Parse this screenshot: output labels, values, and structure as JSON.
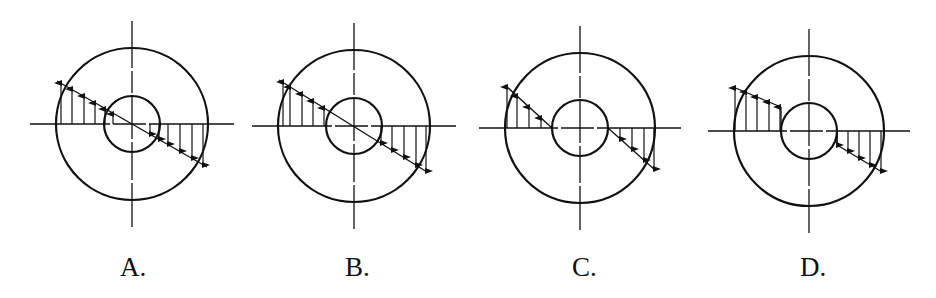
{
  "figure": {
    "stroke_color": "#111111",
    "background": "#ffffff"
  },
  "options": [
    {
      "label": "A.",
      "center": [
        132,
        124
      ],
      "outer_radius": 76,
      "inner_radius": 28,
      "distribution": "linear-through-center-full",
      "profile_lines": [
        [
          [
            57,
            81
          ],
          [
            207,
            167
          ]
        ]
      ],
      "arrows": [
        {
          "x": 61,
          "from": 124,
          "to": 83
        },
        {
          "x": 72,
          "from": 124,
          "to": 89
        },
        {
          "x": 84,
          "from": 124,
          "to": 96
        },
        {
          "x": 95,
          "from": 124,
          "to": 103
        },
        {
          "x": 105,
          "from": 124,
          "to": 109
        },
        {
          "x": 113,
          "from": 124,
          "to": 114
        },
        {
          "x": 150,
          "from": 124,
          "to": 134
        },
        {
          "x": 159,
          "from": 124,
          "to": 139
        },
        {
          "x": 168,
          "from": 124,
          "to": 144
        },
        {
          "x": 180,
          "from": 124,
          "to": 151
        },
        {
          "x": 192,
          "from": 124,
          "to": 158
        },
        {
          "x": 203,
          "from": 124,
          "to": 165
        }
      ]
    },
    {
      "label": "B.",
      "center": [
        354,
        126
      ],
      "outer_radius": 76,
      "inner_radius": 28,
      "distribution": "linear-through-center-annulus",
      "profile_lines": [
        [
          [
            279,
            80
          ],
          [
            427,
            172
          ]
        ]
      ],
      "arrows": [
        {
          "x": 283,
          "from": 126,
          "to": 82
        },
        {
          "x": 290,
          "from": 126,
          "to": 87
        },
        {
          "x": 302,
          "from": 126,
          "to": 94
        },
        {
          "x": 313,
          "from": 126,
          "to": 101
        },
        {
          "x": 324,
          "from": 126,
          "to": 108
        },
        {
          "x": 381,
          "from": 126,
          "to": 143
        },
        {
          "x": 392,
          "from": 126,
          "to": 150
        },
        {
          "x": 404,
          "from": 126,
          "to": 157
        },
        {
          "x": 416,
          "from": 126,
          "to": 165
        },
        {
          "x": 426,
          "from": 126,
          "to": 171
        }
      ]
    },
    {
      "label": "C.",
      "center": [
        580,
        128
      ],
      "outer_radius": 75,
      "inner_radius": 28,
      "distribution": "linear-zero-at-inner-radius",
      "profile_lines": [
        [
          [
            505,
            85
          ],
          [
            552,
            128
          ]
        ],
        [
          [
            608,
            128
          ],
          [
            655,
            170
          ]
        ]
      ],
      "arrows": [
        {
          "x": 507,
          "from": 128,
          "to": 87
        },
        {
          "x": 517,
          "from": 128,
          "to": 96
        },
        {
          "x": 529,
          "from": 128,
          "to": 107
        },
        {
          "x": 541,
          "from": 128,
          "to": 118
        },
        {
          "x": 620,
          "from": 128,
          "to": 139
        },
        {
          "x": 632,
          "from": 128,
          "to": 149
        },
        {
          "x": 644,
          "from": 128,
          "to": 160
        },
        {
          "x": 654,
          "from": 128,
          "to": 169
        }
      ]
    },
    {
      "label": "D.",
      "center": [
        809,
        131
      ],
      "outer_radius": 75,
      "inner_radius": 28,
      "distribution": "linear-nonzero-at-inner-radius",
      "profile_lines": [
        [
          [
            733,
            87
          ],
          [
            781,
            107
          ]
        ],
        [
          [
            837,
            145
          ],
          [
            882,
            172
          ]
        ]
      ],
      "arrows": [
        {
          "x": 735,
          "from": 131,
          "to": 88
        },
        {
          "x": 746,
          "from": 131,
          "to": 92
        },
        {
          "x": 757,
          "from": 131,
          "to": 97
        },
        {
          "x": 769,
          "from": 131,
          "to": 102
        },
        {
          "x": 780,
          "from": 131,
          "to": 107
        },
        {
          "x": 837,
          "from": 131,
          "to": 145
        },
        {
          "x": 848,
          "from": 131,
          "to": 151
        },
        {
          "x": 859,
          "from": 131,
          "to": 158
        },
        {
          "x": 870,
          "from": 131,
          "to": 165
        },
        {
          "x": 881,
          "from": 131,
          "to": 171
        }
      ]
    }
  ],
  "label_positions": [
    120,
    345,
    572,
    800
  ]
}
